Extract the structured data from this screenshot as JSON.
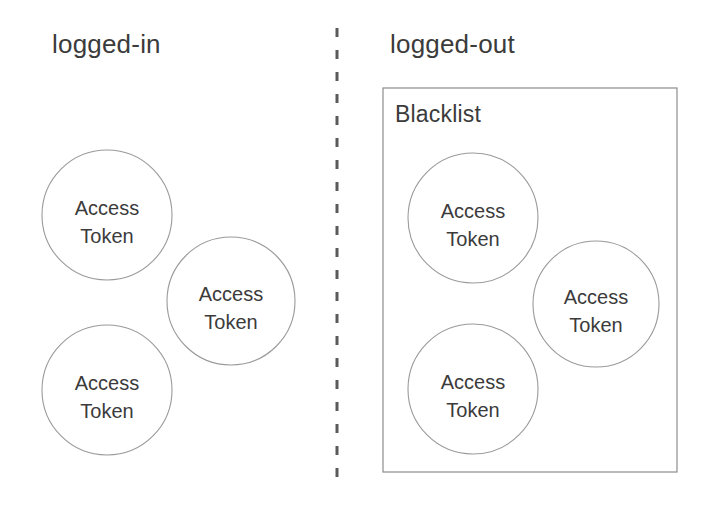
{
  "diagram": {
    "title_left": "logged-in",
    "title_right": "logged-out",
    "group_label": "Blacklist",
    "colors": {
      "background": "#ffffff",
      "text": "#3b3b3b",
      "circle_stroke": "#9a9a9a",
      "box_stroke": "#8c8c8c",
      "divider_stroke": "#5a5a5a"
    },
    "divider": {
      "x": 337,
      "y_top": 28,
      "y_bottom": 490,
      "style": "dashed"
    },
    "left_panel": {
      "title": "logged-in",
      "title_x": 52,
      "title_y": 53,
      "nodes": [
        {
          "line1": "Access",
          "line2": "Token",
          "cx": 107,
          "cy": 215,
          "r": 65
        },
        {
          "line1": "Access",
          "line2": "Token",
          "cx": 231,
          "cy": 301,
          "r": 64
        },
        {
          "line1": "Access",
          "line2": "Token",
          "cx": 107,
          "cy": 390,
          "r": 65
        }
      ]
    },
    "right_panel": {
      "title": "logged-out",
      "title_x": 390,
      "title_y": 53,
      "group": {
        "label": "Blacklist",
        "label_x": 395,
        "label_y": 122,
        "x": 383,
        "y": 88,
        "width": 294,
        "height": 384
      },
      "nodes": [
        {
          "line1": "Access",
          "line2": "Token",
          "cx": 473,
          "cy": 218,
          "r": 65
        },
        {
          "line1": "Access",
          "line2": "Token",
          "cx": 596,
          "cy": 304,
          "r": 63
        },
        {
          "line1": "Access",
          "line2": "Token",
          "cx": 473,
          "cy": 389,
          "r": 65
        }
      ]
    }
  }
}
